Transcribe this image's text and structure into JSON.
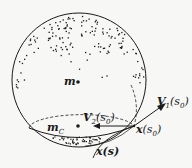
{
  "diagram": {
    "type": "sphere-with-curve",
    "colors": {
      "ink": "#1a1a1a",
      "background": "#f7f7f5"
    },
    "labels": {
      "m": "m",
      "mC_main": "m",
      "mC_sub": "C",
      "V1_main": "V",
      "V1_sub": "1",
      "V1_arg": "(s",
      "V1_argsub": "0",
      "V1_close": ")",
      "V2_main": "V",
      "V2_sub": "2",
      "V2_arg": "(s",
      "V2_argsub": "0",
      "V2_close": ")",
      "xs0_main": "x",
      "xs0_arg": "(s",
      "xs0_argsub": "0",
      "xs0_close": ")",
      "xs": "x(s)"
    },
    "elements": [
      "sphere outline",
      "dense dot cloud near top cap",
      "sparse dot cloud near bottom cap",
      "point m (sphere center)",
      "point m_C (center of circle C)",
      "dashed ellipse circle C",
      "dashed meridian arc",
      "tangent vector V1(s0)",
      "inward vector V2(s0)",
      "curve x(s) passing through x(s0)"
    ]
  }
}
